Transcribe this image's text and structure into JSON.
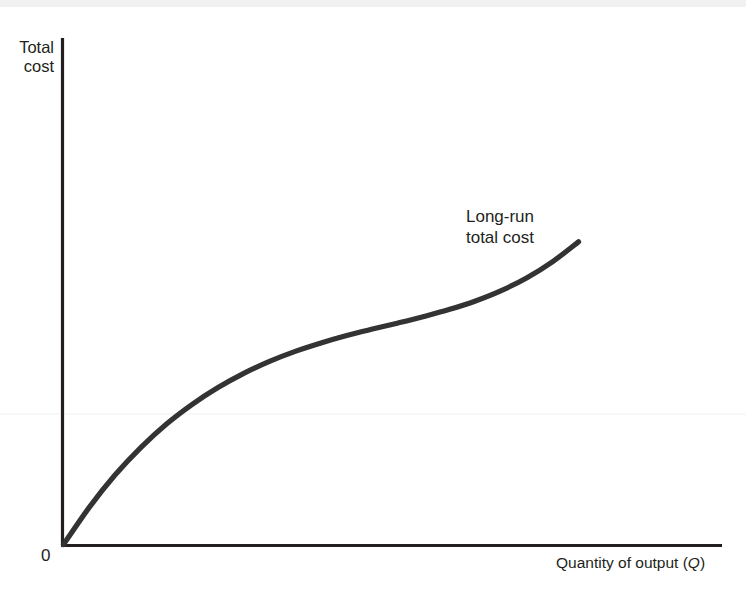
{
  "figure": {
    "background_color": "#ffffff",
    "ink_color": "#231f20",
    "curve_color": "#333333"
  },
  "axes": {
    "y_axis_title": "Total\ncost",
    "y_axis_title_line1": "Total",
    "y_axis_title_line2": "cost",
    "x_axis_title_text": "Quantity of output (",
    "x_axis_title_variable": "Q",
    "x_axis_title_close": ")",
    "origin_label": "0"
  },
  "annotations": {
    "curve_label_line1": "Long-run",
    "curve_label_line2": "total cost"
  },
  "chart_data": {
    "type": "line",
    "title": "",
    "xlabel": "Quantity of output (Q)",
    "ylabel": "Total cost",
    "grid": false,
    "legend": "none",
    "series": [
      {
        "name": "Long-run total cost",
        "comment": "Cubic-shaped long-run total cost curve: steep from origin, concave (flattening) through the middle, then convex (steepening) at high output. Values are normalized 0-1 on both axes.",
        "x": [
          0.0,
          0.05,
          0.1,
          0.15,
          0.2,
          0.25,
          0.3,
          0.35,
          0.4,
          0.45,
          0.5,
          0.55,
          0.6,
          0.65,
          0.7,
          0.75,
          0.8,
          0.85,
          0.9,
          0.95,
          1.0
        ],
        "y": [
          0.0,
          0.115,
          0.215,
          0.3,
          0.373,
          0.434,
          0.486,
          0.53,
          0.567,
          0.598,
          0.624,
          0.647,
          0.667,
          0.686,
          0.706,
          0.728,
          0.754,
          0.786,
          0.826,
          0.876,
          0.937
        ]
      }
    ],
    "xlim": [
      0,
      1
    ],
    "ylim": [
      0,
      1
    ],
    "x_tick_labels": [
      "0"
    ],
    "y_tick_labels": [],
    "annotation_label": "Long-run total cost"
  }
}
